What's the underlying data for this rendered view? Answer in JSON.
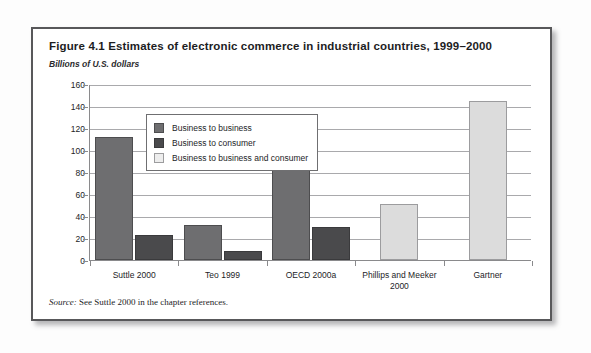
{
  "figure": {
    "title": "Figure 4.1  Estimates of electronic commerce in industrial countries, 1999–2000",
    "subtitle": "Billions of U.S. dollars",
    "source_label": "Source:",
    "source_text": " See Suttle 2000 in the chapter references."
  },
  "legend": {
    "items": [
      {
        "label": "Business to business",
        "series": "b2b",
        "color": "#6e6e70"
      },
      {
        "label": "Business to consumer",
        "series": "b2c",
        "color": "#4a4a4c"
      },
      {
        "label": "Business to business and consumer",
        "series": "b2bc",
        "color": "#ededed"
      }
    ]
  },
  "chart_data": {
    "type": "bar",
    "title": "Figure 4.1  Estimates of electronic commerce in industrial countries, 1999–2000",
    "subtitle": "Billions of U.S. dollars",
    "xlabel": "",
    "ylabel": "Billions of U.S. dollars",
    "ylim": [
      0,
      160
    ],
    "yticks": [
      0,
      20,
      40,
      60,
      80,
      100,
      120,
      140,
      160
    ],
    "grid": true,
    "legend_position": "upper-left-inside",
    "categories": [
      "Suttle 2000",
      "Teo 1999",
      "OECD 2000a",
      "Phillips and Meeker 2000",
      "Gartner"
    ],
    "series": [
      {
        "name": "Business to business",
        "key": "b2b",
        "color": "#6e6e70",
        "values": [
          112,
          32,
          90,
          null,
          null
        ]
      },
      {
        "name": "Business to consumer",
        "key": "b2c",
        "color": "#4a4a4c",
        "values": [
          23,
          8,
          30,
          null,
          null
        ]
      },
      {
        "name": "Business to business and consumer",
        "key": "b2bc",
        "color": "#dcdcdc",
        "values": [
          null,
          null,
          null,
          51,
          145
        ]
      }
    ]
  }
}
